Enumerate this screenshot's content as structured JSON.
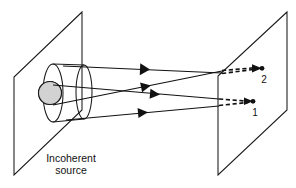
{
  "figure": {
    "background_color": "#ffffff",
    "line_color": "#111111",
    "source_fill_color": "#d2d2d2",
    "caption": {
      "line1": "Incoherent",
      "line2": "source",
      "x": 71,
      "y": 162
    },
    "planes": [
      {
        "name": "source-plane",
        "points": "82,12 14,77 14,175 82,110"
      },
      {
        "name": "observation-plane",
        "points": "287,12 218,76 218,175 287,110"
      }
    ],
    "source": {
      "disk": {
        "cx": 50,
        "cy": 93,
        "r": 11.5,
        "label": "source-disk"
      },
      "near_ellipse": {
        "cx": 53,
        "cy": 93,
        "rx": 10,
        "ry": 29
      },
      "far_ellipse": {
        "cx": 84,
        "cy": 92,
        "rx": 8,
        "ry": 27
      },
      "tube_top": {
        "x1": 53,
        "y1": 64,
        "x2": 84,
        "y2": 65
      },
      "tube_bottom": {
        "x1": 53,
        "y1": 122,
        "x2": 84,
        "y2": 119
      }
    },
    "rays": [
      {
        "name": "ray-upper-outer",
        "from": [
          63,
          66
        ],
        "to": [
          222,
          73
        ],
        "arrow_at": 0.52,
        "converges_to": "point-2"
      },
      {
        "name": "ray-lower-to-point-2",
        "from": [
          53,
          105
        ],
        "to": [
          222,
          71
        ],
        "arrow_at": 0.56,
        "converges_to": "point-2"
      },
      {
        "name": "ray-upper-to-point-1",
        "from": [
          53,
          85
        ],
        "to": [
          219,
          99
        ],
        "arrow_at": 0.56,
        "converges_to": "point-1"
      },
      {
        "name": "ray-lower-outer",
        "from": [
          66,
          120
        ],
        "to": [
          219,
          106
        ],
        "arrow_at": 0.54,
        "converges_to": "point-1"
      }
    ],
    "dashed_extensions": [
      {
        "name": "dash-to-point-2-upper",
        "from": [
          222,
          73
        ],
        "to": [
          259,
          69
        ]
      },
      {
        "name": "dash-to-point-2-lower",
        "from": [
          222,
          71
        ],
        "to": [
          259,
          68
        ]
      },
      {
        "name": "dash-to-point-1-upper",
        "from": [
          219,
          99
        ],
        "to": [
          250,
          101
        ]
      },
      {
        "name": "dash-to-point-1-lower",
        "from": [
          219,
          106
        ],
        "to": [
          250,
          102
        ]
      }
    ],
    "points": [
      {
        "name": "point-2",
        "label": "2",
        "dot": [
          262,
          68
        ],
        "label_pos": [
          264,
          83
        ]
      },
      {
        "name": "point-1",
        "label": "1",
        "dot": [
          253,
          101
        ],
        "label_pos": [
          255,
          116
        ]
      }
    ]
  }
}
